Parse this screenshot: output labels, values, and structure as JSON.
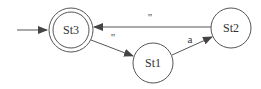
{
  "diagram": {
    "type": "finite-state-automaton",
    "stroke_color": "#555555",
    "text_color": "#333333",
    "background": "#ffffff",
    "states": [
      {
        "id": "St3",
        "label": "St3",
        "accepting": true,
        "initial": true
      },
      {
        "id": "St1",
        "label": "St1",
        "accepting": false,
        "initial": false
      },
      {
        "id": "St2",
        "label": "St2",
        "accepting": false,
        "initial": false
      }
    ],
    "transitions": [
      {
        "from": "St3",
        "to": "St1",
        "label": "\""
      },
      {
        "from": "St1",
        "to": "St2",
        "label": "a"
      },
      {
        "from": "St2",
        "to": "St3",
        "label": "\""
      }
    ]
  }
}
